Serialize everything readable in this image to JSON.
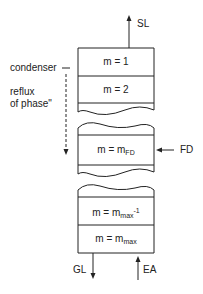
{
  "diagram": {
    "type": "extraction column stage diagram",
    "stages": [
      {
        "id": "stage-1",
        "label": "m = 1"
      },
      {
        "id": "stage-2",
        "label": "m = 2"
      },
      {
        "id": "stage-fd",
        "label_main": "m = m",
        "label_sub": "FD"
      },
      {
        "id": "stage-max-minus-1",
        "label_main": "m = m",
        "label_sub": "max",
        "label_sup": "-1"
      },
      {
        "id": "stage-max",
        "label_main": "m = m",
        "label_sub": "max"
      }
    ],
    "streams": {
      "top_out": "SL",
      "feed_in": "FD",
      "bottom_out": "GL",
      "bottom_in": "EA"
    },
    "annotations": {
      "condenser": "condenser",
      "reflux_line1": "reflux",
      "reflux_line2": "of phase\""
    },
    "colors": {
      "line": "#222222",
      "background": "#ffffff"
    }
  }
}
